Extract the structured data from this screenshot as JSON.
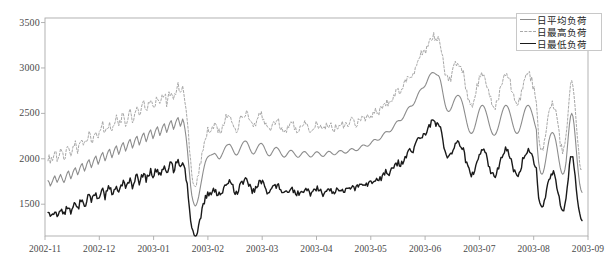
{
  "chart_data": {
    "type": "line",
    "title": "",
    "xlabel": "",
    "ylabel": "",
    "ylim": [
      1150,
      3550
    ],
    "yticks": [
      1500,
      2000,
      2500,
      3000,
      3500
    ],
    "ytick_labels": [
      "1500",
      "2000",
      "2500",
      "3000",
      "3500"
    ],
    "xtick_labels": [
      "2002-11",
      "2002-12",
      "2003-01",
      "2003-02",
      "2003-03",
      "2003-04",
      "2003-05",
      "2003-06",
      "2003-07",
      "2003-08",
      "2003-09"
    ],
    "grid": false,
    "legend_position": "top-right",
    "frame": true,
    "x_start": "2002-11-01",
    "x_end": "2003-09-01",
    "series": [
      {
        "name": "日平均负荷",
        "style": "solid",
        "color": "#8c8c8c",
        "width": 1.1,
        "values": [
          1760,
          1742,
          1700,
          1726,
          1755,
          1790,
          1812,
          1775,
          1741,
          1768,
          1800,
          1828,
          1795,
          1762,
          1738,
          1770,
          1812,
          1848,
          1866,
          1820,
          1780,
          1812,
          1855,
          1884,
          1901,
          1862,
          1824,
          1856,
          1900,
          1930,
          1948,
          1902,
          1864,
          1898,
          1942,
          1972,
          1990,
          1944,
          1902,
          1938,
          1982,
          2012,
          2030,
          1984,
          1940,
          1974,
          2018,
          2050,
          2070,
          2022,
          1978,
          2012,
          2056,
          2088,
          2105,
          2058,
          2012,
          2048,
          2092,
          2124,
          2142,
          2094,
          2048,
          2082,
          2128,
          2160,
          2178,
          2130,
          2084,
          2118,
          2162,
          2196,
          2214,
          2166,
          2118,
          2152,
          2198,
          2230,
          2248,
          2200,
          2152,
          2188,
          2232,
          2266,
          2284,
          2236,
          2188,
          2222,
          2268,
          2300,
          2318,
          2270,
          2222,
          2256,
          2302,
          2334,
          2352,
          2304,
          2256,
          2290,
          2336,
          2368,
          2386,
          2338,
          2290,
          2324,
          2370,
          2402,
          2420,
          2372,
          2324,
          2358,
          2404,
          2436,
          2454,
          2406,
          2358,
          2392,
          2438,
          2400,
          2330,
          2240,
          2120,
          1980,
          1840,
          1700,
          1600,
          1540,
          1500,
          1480,
          1492,
          1528,
          1580,
          1650,
          1720,
          1790,
          1860,
          1920,
          1968,
          2000,
          2020,
          2030,
          2038,
          2042,
          2048,
          2054,
          2060,
          2050,
          2030,
          2010,
          1998,
          2008,
          2032,
          2060,
          2090,
          2118,
          2140,
          2152,
          2158,
          2160,
          2150,
          2128,
          2100,
          2072,
          2050,
          2040,
          2048,
          2070,
          2100,
          2130,
          2158,
          2180,
          2192,
          2196,
          2190,
          2170,
          2140,
          2108,
          2080,
          2060,
          2052,
          2060,
          2082,
          2110,
          2136,
          2156,
          2168,
          2170,
          2160,
          2140,
          2112,
          2082,
          2056,
          2038,
          2032,
          2040,
          2060,
          2084,
          2106,
          2120,
          2126,
          2120,
          2106,
          2086,
          2062,
          2040,
          2024,
          2018,
          2024,
          2040,
          2060,
          2078,
          2090,
          2094,
          2088,
          2074,
          2056,
          2038,
          2024,
          2016,
          2020,
          2034,
          2052,
          2068,
          2078,
          2080,
          2072,
          2058,
          2042,
          2028,
          2020,
          2022,
          2034,
          2050,
          2066,
          2076,
          2078,
          2070,
          2056,
          2042,
          2030,
          2026,
          2032,
          2046,
          2062,
          2076,
          2082,
          2080,
          2070,
          2058,
          2048,
          2044,
          2048,
          2060,
          2074,
          2086,
          2092,
          2090,
          2082,
          2072,
          2064,
          2062,
          2068,
          2080,
          2094,
          2106,
          2112,
          2110,
          2102,
          2094,
          2090,
          2092,
          2100,
          2114,
          2130,
          2144,
          2152,
          2152,
          2146,
          2140,
          2138,
          2144,
          2156,
          2172,
          2190,
          2204,
          2212,
          2212,
          2208,
          2204,
          2206,
          2216,
          2232,
          2252,
          2272,
          2288,
          2298,
          2300,
          2298,
          2296,
          2300,
          2312,
          2332,
          2356,
          2380,
          2400,
          2414,
          2420,
          2420,
          2420,
          2428,
          2444,
          2468,
          2496,
          2524,
          2548,
          2566,
          2576,
          2580,
          2582,
          2592,
          2612,
          2640,
          2672,
          2704,
          2732,
          2754,
          2768,
          2776,
          2782,
          2794,
          2816,
          2846,
          2878,
          2908,
          2930,
          2944,
          2950,
          2948,
          2940,
          2930,
          2922,
          2918,
          2900,
          2860,
          2800,
          2730,
          2660,
          2600,
          2556,
          2530,
          2520,
          2526,
          2546,
          2576,
          2610,
          2644,
          2672,
          2690,
          2698,
          2696,
          2684,
          2660,
          2624,
          2576,
          2520,
          2460,
          2400,
          2348,
          2310,
          2286,
          2278,
          2286,
          2310,
          2348,
          2396,
          2448,
          2498,
          2540,
          2570,
          2586,
          2588,
          2576,
          2550,
          2512,
          2466,
          2416,
          2366,
          2322,
          2288,
          2266,
          2258,
          2266,
          2288,
          2322,
          2366,
          2416,
          2466,
          2512,
          2550,
          2576,
          2588,
          2586,
          2570,
          2540,
          2498,
          2448,
          2396,
          2348,
          2310,
          2286,
          2278,
          2286,
          2310,
          2348,
          2396,
          2448,
          2498,
          2540,
          2570,
          2586,
          2588,
          2576,
          2550,
          2512,
          2466,
          2416,
          2366,
          2322,
          2100,
          1960,
          1880,
          1840,
          1830,
          1850,
          1900,
          1970,
          2050,
          2130,
          2200,
          2250,
          2280,
          2290,
          2280,
          2250,
          2200,
          2130,
          2050,
          1970,
          1900,
          1850,
          1830,
          1840,
          1880,
          1960,
          2100,
          2250,
          2380,
          2470,
          2500,
          2470,
          2380,
          2250,
          2100,
          1950,
          1820,
          1720,
          1660,
          1630
        ]
      },
      {
        "name": "日最高负荷",
        "style": "dashed",
        "color": "#a8a8a8",
        "width": 1.0,
        "offset_above_avg": 310
      },
      {
        "name": "日最低负荷",
        "style": "solid",
        "color": "#1a1a1a",
        "width": 1.4,
        "offset_below_avg": 430
      }
    ]
  },
  "legend": {
    "items": [
      {
        "label": "日平均负荷",
        "swatch": "line-solid-gray"
      },
      {
        "label": "日最高负荷",
        "swatch": "line-dashed-gray"
      },
      {
        "label": "日最低负荷",
        "swatch": "line-solid-black"
      }
    ]
  },
  "axes": {
    "y_tick_labels": [
      "3500",
      "3000",
      "2500",
      "2000",
      "1500"
    ],
    "x_tick_labels": [
      "2002-11",
      "2002-12",
      "2003-01",
      "2003-02",
      "2003-03",
      "2003-04",
      "2003-05",
      "2003-06",
      "2003-07",
      "2003-08",
      "2003-09"
    ]
  },
  "colors": {
    "avg": "#8c8c8c",
    "max": "#a8a8a8",
    "min": "#1a1a1a",
    "frame": "#aaaaaa",
    "text": "#4a4a4a",
    "background": "#ffffff"
  }
}
